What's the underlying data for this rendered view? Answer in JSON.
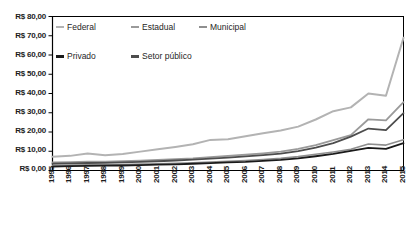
{
  "chart_data": {
    "type": "line",
    "title": "",
    "subtitle": "",
    "xlabel": "",
    "ylabel": "",
    "x": [
      1995,
      1996,
      1997,
      1998,
      1999,
      2000,
      2001,
      2002,
      2003,
      2004,
      2005,
      2006,
      2007,
      2008,
      2009,
      2010,
      2011,
      2012,
      2013,
      2014,
      2015
    ],
    "categories": [
      "1995",
      "1996",
      "1997",
      "1998",
      "1999",
      "2000",
      "2001",
      "2002",
      "2003",
      "2004",
      "2005",
      "2006",
      "2007",
      "2008",
      "2009",
      "2010",
      "2011",
      "2012",
      "2013",
      "2014",
      "2015"
    ],
    "ylim": [
      0,
      80
    ],
    "ytick_values": [
      0,
      10,
      20,
      30,
      40,
      50,
      60,
      70,
      80
    ],
    "ytick_labels": [
      "R$ 0,00",
      "R$ 10,00",
      "R$ 20,00",
      "R$ 30,00",
      "R$ 40,00",
      "R$ 50,00",
      "R$ 60,00",
      "R$ 70,00",
      "R$ 80,00"
    ],
    "grid": false,
    "legend_position": "top-left-inside",
    "series": [
      {
        "name": "Federal",
        "color": "#b3b3b3",
        "values": [
          7.2,
          7.6,
          8.8,
          7.9,
          8.6,
          9.8,
          11.0,
          12.2,
          13.6,
          15.9,
          16.2,
          17.8,
          19.3,
          20.8,
          22.8,
          26.5,
          30.8,
          32.8,
          40.0,
          38.8,
          69.0
        ]
      },
      {
        "name": "Estadual",
        "color": "#9a9a9a",
        "values": [
          4.2,
          4.3,
          4.6,
          4.6,
          4.8,
          5.1,
          5.5,
          5.9,
          6.3,
          7.0,
          7.6,
          8.2,
          8.9,
          9.8,
          11.2,
          13.2,
          15.8,
          18.4,
          26.6,
          26.0,
          35.5
        ]
      },
      {
        "name": "Municipal",
        "color": "#8f8f8f",
        "values": [
          2.6,
          2.8,
          2.9,
          3.0,
          3.1,
          3.3,
          3.5,
          3.8,
          4.0,
          4.4,
          4.8,
          5.2,
          5.7,
          6.3,
          7.2,
          8.4,
          9.6,
          11.0,
          13.8,
          13.2,
          16.0
        ]
      },
      {
        "name": "Privado",
        "color": "#1a1a1a",
        "values": [
          2.0,
          2.3,
          2.4,
          2.5,
          2.6,
          2.8,
          3.0,
          3.2,
          3.5,
          3.8,
          4.2,
          4.5,
          5.0,
          5.5,
          6.3,
          7.4,
          8.6,
          10.2,
          11.8,
          11.2,
          14.2
        ]
      },
      {
        "name": "Setor público",
        "color": "#4d4d4d",
        "values": [
          3.5,
          3.7,
          3.9,
          4.0,
          4.2,
          4.5,
          4.8,
          5.2,
          5.6,
          6.2,
          6.7,
          7.3,
          8.0,
          8.8,
          10.1,
          11.9,
          14.2,
          17.6,
          21.8,
          21.0,
          29.8
        ]
      }
    ],
    "legend": [
      {
        "label": "Federal",
        "color": "#b3b3b3"
      },
      {
        "label": "Estadual",
        "color": "#9a9a9a"
      },
      {
        "label": "Municipal",
        "color": "#8f8f8f"
      },
      {
        "label": "Privado",
        "color": "#1a1a1a"
      },
      {
        "label": "Setor público",
        "color": "#4d4d4d"
      }
    ]
  }
}
